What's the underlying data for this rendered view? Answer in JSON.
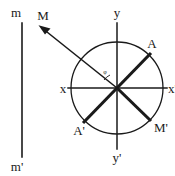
{
  "figure": {
    "type": "geometric-vector-diagram",
    "background_color": "#ffffff",
    "ink_color": "#1a1a1a",
    "labels": {
      "bar_top": "m",
      "bar_bottom": "m'",
      "axis_y_top": "y",
      "axis_y_bottom": "y'",
      "axis_x_left": "x",
      "axis_x_right": "x'",
      "point_a": "A",
      "point_a_prime": "A'",
      "vector_m": "M",
      "point_m_prime": "M'",
      "angle": "φ"
    },
    "geometry": {
      "circle": {
        "cx": 117,
        "cy": 88,
        "r": 46
      },
      "vertical_bar": {
        "x": 22,
        "y_top": 22,
        "y_bottom": 158
      },
      "axis_x": {
        "x1": 68,
        "y1": 88,
        "x2": 168,
        "y2": 88
      },
      "axis_y": {
        "x1": 117,
        "y1": 24,
        "x2": 117,
        "y2": 148
      },
      "chord_aa_prime": {
        "x1": 150,
        "y1": 54,
        "x2": 84,
        "y2": 122
      },
      "chord_mm_prime": {
        "x1": 40,
        "y1": 26,
        "x2": 150,
        "y2": 120
      },
      "arrow_head_at": {
        "x": 40,
        "y": 26
      }
    }
  }
}
